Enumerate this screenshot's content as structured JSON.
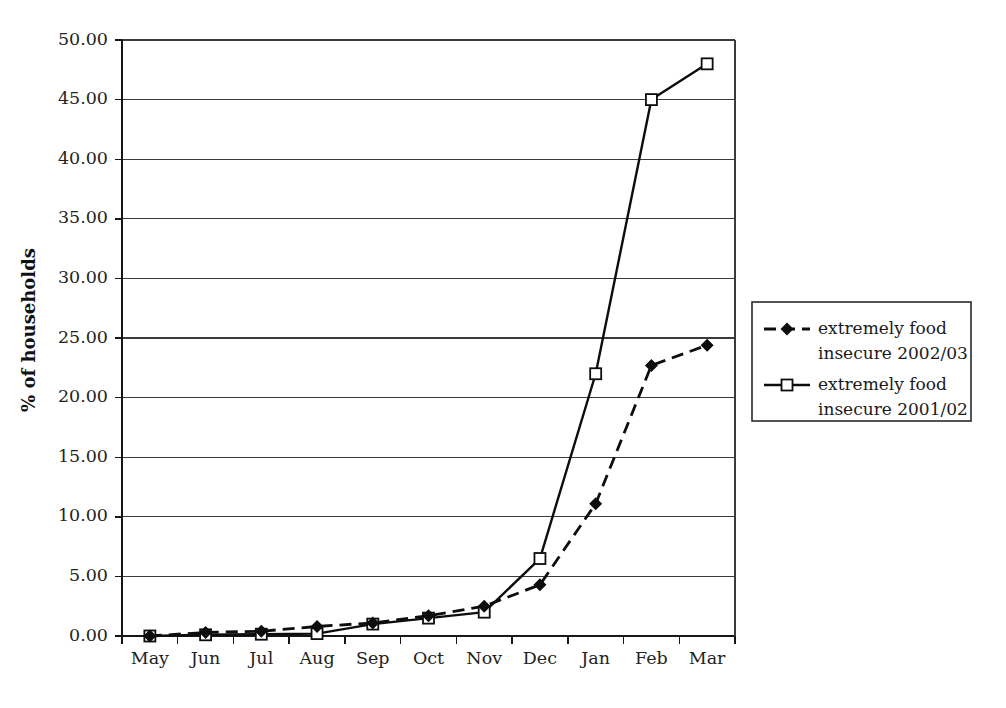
{
  "chart_data": {
    "type": "line",
    "title": "",
    "xlabel": "",
    "ylabel": "% of households",
    "categories": [
      "May",
      "Jun",
      "Jul",
      "Aug",
      "Sep",
      "Oct",
      "Nov",
      "Dec",
      "Jan",
      "Feb",
      "Mar"
    ],
    "ylim": [
      0,
      50
    ],
    "ytick_step": 5,
    "ytick_labels": [
      "0.00",
      "5.00",
      "10.00",
      "15.00",
      "20.00",
      "25.00",
      "30.00",
      "35.00",
      "40.00",
      "45.00",
      "50.00"
    ],
    "grid": true,
    "legend_position": "right",
    "series": [
      {
        "name": "extremely food insecure 2002/03",
        "label_line1": "extremely food",
        "label_line2": "insecure 2002/03",
        "marker": "filled-diamond",
        "line_style": "dashed",
        "color": "#0d0d0d",
        "values": [
          0.0,
          0.3,
          0.4,
          0.8,
          1.1,
          1.7,
          2.5,
          4.3,
          11.1,
          22.7,
          24.4
        ]
      },
      {
        "name": "extremely food insecure 2001/02",
        "label_line1": "extremely food",
        "label_line2": "insecure 2001/02",
        "marker": "open-square",
        "line_style": "solid",
        "color": "#0d0d0d",
        "values": [
          0.0,
          0.1,
          0.15,
          0.2,
          1.0,
          1.5,
          2.0,
          6.5,
          22.0,
          45.0,
          48.0
        ]
      }
    ]
  },
  "axes": {
    "y_axis_title": "% of households"
  },
  "legend": {
    "entries": [
      {
        "line1": "extremely food",
        "line2": "insecure 2002/03",
        "marker": "filled-diamond"
      },
      {
        "line1": "extremely food",
        "line2": "insecure 2001/02",
        "marker": "open-square"
      }
    ]
  },
  "caption": {
    "text": ""
  }
}
